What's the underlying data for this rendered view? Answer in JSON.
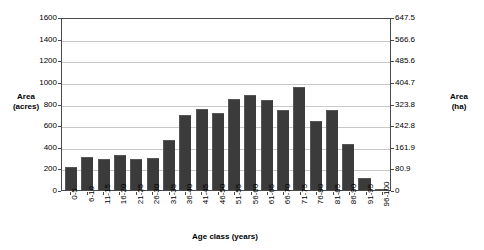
{
  "chart_data": {
    "type": "bar",
    "title": "",
    "xlabel": "Age class (years)",
    "ylabel": "Area (acres)",
    "ylabel_secondary": "Area (ha)",
    "categories": [
      "0-5",
      "6-10",
      "11-15",
      "16-20",
      "21-25",
      "26-30",
      "31-35",
      "36-40",
      "41-45",
      "46-50",
      "51-55",
      "56-60",
      "61-65",
      "66-70",
      "71-75",
      "76-80",
      "81-85",
      "86-90",
      "91-95",
      "96-100"
    ],
    "values": [
      215,
      310,
      290,
      330,
      290,
      295,
      465,
      700,
      760,
      720,
      855,
      890,
      845,
      750,
      965,
      650,
      745,
      430,
      110,
      12
    ],
    "ylim": [
      0,
      1600
    ],
    "ylim_secondary": [
      0,
      647.5
    ],
    "yticks": [
      0,
      200,
      400,
      600,
      800,
      1000,
      1200,
      1400,
      1600
    ],
    "yticks_secondary": [
      "0",
      "80.9",
      "161.9",
      "242.8",
      "323.8",
      "404.7",
      "485.6",
      "566.6",
      "647.5"
    ],
    "grid": true,
    "legend": "none",
    "bar_color": "#3b3b3b",
    "gridline_color": "#c9c9c9",
    "axis_color": "#4a4a4a",
    "background": "#ffffff"
  },
  "axes": {
    "left_title_line1": "Area",
    "left_title_line2": "(acres)",
    "right_title_line1": "Area",
    "right_title_line2": "(ha)",
    "x_title": "Age class (years)"
  }
}
